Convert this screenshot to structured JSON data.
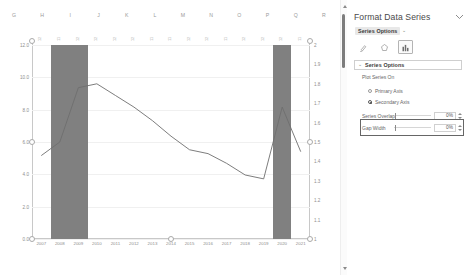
{
  "spreadsheet": {
    "column_headers": [
      "G",
      "H",
      "I",
      "J",
      "K",
      "L",
      "M",
      "N",
      "O",
      "P",
      "Q",
      "R"
    ]
  },
  "panel": {
    "title": "Format Data Series",
    "collapse_icon": "chevron-down-icon",
    "series_options_dropdown": "Series Options",
    "dropdown_caret": "⌄",
    "icon_tabs": [
      {
        "name": "fill-and-line-icon",
        "label": "Fill & Line",
        "active": false
      },
      {
        "name": "effects-icon",
        "label": "Effects",
        "active": false
      },
      {
        "name": "series-options-icon",
        "label": "Series Options",
        "active": true
      }
    ],
    "section": {
      "caret": "⌄",
      "title": "Series Options",
      "plot_series_on_label": "Plot Series On",
      "radios": [
        {
          "label": "Primary Axis",
          "checked": false
        },
        {
          "label": "Secondary Axis",
          "checked": true
        }
      ],
      "sliders": [
        {
          "label": "Series Overlap",
          "value": "0%"
        },
        {
          "label": "Gap Width",
          "value": "0%"
        }
      ]
    }
  },
  "chart_data": {
    "type": "bar",
    "title": "",
    "xlabel": "",
    "ylabel": "",
    "categories": [
      "2007",
      "2008",
      "2009",
      "2010",
      "2011",
      "2012",
      "2013",
      "2014",
      "2015",
      "2016",
      "2017",
      "2018",
      "2019",
      "2020",
      "2021"
    ],
    "grid": true,
    "legend_position": "none",
    "left_axis": {
      "ticks": [
        "0.0",
        "2.0",
        "4.0",
        "6.0",
        "8.0",
        "10.0",
        "12.0"
      ],
      "ylim": [
        0,
        12
      ]
    },
    "right_axis": {
      "ticks": [
        "1",
        "1.1",
        "1.2",
        "1.3",
        "1.4",
        "1.5",
        "1.6",
        "1.7",
        "1.8",
        "1.9",
        "2"
      ],
      "ylim": [
        1,
        2
      ]
    },
    "series": [
      {
        "name": "Bars",
        "type": "bar",
        "axis": "primary",
        "color": "#808080",
        "values": [
          0,
          12.0,
          12.0,
          0,
          0,
          0,
          0,
          0,
          0,
          0,
          0,
          0,
          0,
          12.0,
          0
        ]
      },
      {
        "name": "Line",
        "type": "line",
        "axis": "secondary",
        "color": "#6e6e6e",
        "values": [
          1.43,
          1.5,
          1.78,
          1.8,
          1.74,
          1.68,
          1.61,
          1.53,
          1.46,
          1.44,
          1.39,
          1.33,
          1.31,
          1.68,
          1.45
        ]
      }
    ],
    "top_data_labels": [
      "12",
      "11",
      "12",
      "12",
      "12",
      "12",
      "11",
      "11",
      "12",
      "12",
      "11",
      "12",
      "12",
      "12",
      "11"
    ]
  }
}
